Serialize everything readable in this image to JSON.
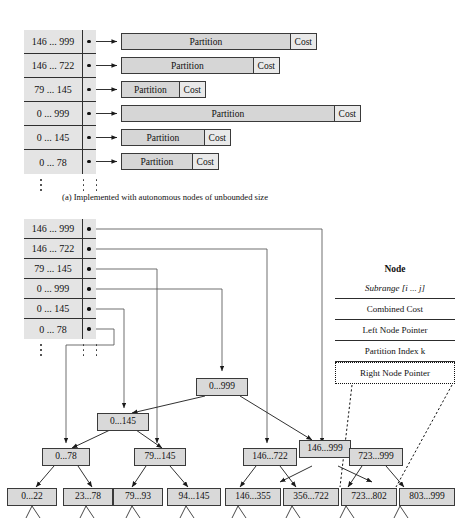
{
  "figure": {
    "caption_a": "(a) Implemented with autonomous nodes of unbounded size"
  },
  "panel_a": {
    "table_rows": [
      {
        "range": "146 ... 999"
      },
      {
        "range": "146 ... 722"
      },
      {
        "range": "79 ... 145"
      },
      {
        "range": "0 ... 999"
      },
      {
        "range": "0 ... 145"
      },
      {
        "range": "0 ... 78"
      }
    ],
    "bars": [
      {
        "partition": "Partition",
        "cost": "Cost"
      },
      {
        "partition": "Partition",
        "cost": "Cost"
      },
      {
        "partition": "Partition",
        "cost": "Cost"
      },
      {
        "partition": "Partition",
        "cost": "Cost"
      },
      {
        "partition": "Partition",
        "cost": "Cost"
      },
      {
        "partition": "Partition",
        "cost": "Cost"
      }
    ]
  },
  "panel_b": {
    "table_rows": [
      {
        "range": "146 ... 999"
      },
      {
        "range": "146 ... 722"
      },
      {
        "range": "79 ... 145"
      },
      {
        "range": "0 ... 999"
      },
      {
        "range": "0 ... 145"
      },
      {
        "range": "0 ... 78"
      }
    ],
    "legend": {
      "title": "Node",
      "fields": [
        "Subrange [i ... j]",
        "Combined Cost",
        "Left Node Pointer",
        "Partition Index k",
        "Right Node Pointer"
      ]
    },
    "tree": {
      "level_root": [
        "0...999"
      ],
      "level_2": [
        "0...145",
        "146...999"
      ],
      "level_3": [
        "0...78",
        "79...145",
        "146...722",
        "723...999"
      ],
      "level_4": [
        "0...22",
        "23...78",
        "79...93",
        "94...145",
        "146...355",
        "356...722",
        "723...802",
        "803...999"
      ]
    }
  },
  "colors": {
    "box_fill": "#d9d9d9",
    "table_fill": "#e4e4e4",
    "stroke": "#2f2f2f",
    "page_bg": "#ffffff"
  }
}
